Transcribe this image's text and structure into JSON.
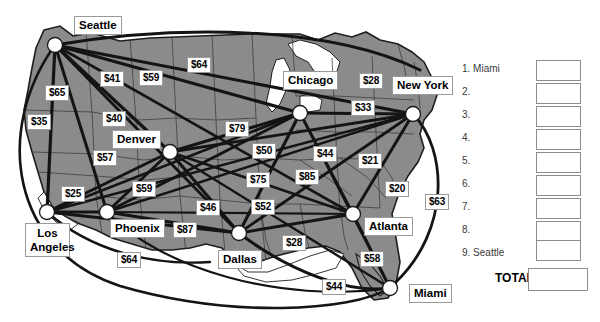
{
  "map": {
    "title": "US airline route map with fares",
    "fill_color": "#8c8c8c",
    "route_color": "#1a1a1a",
    "border_color": "#2b2b2b",
    "node_color": "#ffffff",
    "cities": [
      {
        "name": "Seattle",
        "label": "Seattle",
        "x": 55,
        "y": 45,
        "lx": 74,
        "ly": 16
      },
      {
        "name": "Denver",
        "label": "Denver",
        "x": 170,
        "y": 152,
        "lx": 112,
        "ly": 130
      },
      {
        "name": "Chicago",
        "label": "Chicago",
        "x": 300,
        "y": 113,
        "lx": 283,
        "ly": 71
      },
      {
        "name": "NewYork",
        "label": "New York",
        "x": 413,
        "y": 114,
        "lx": 392,
        "ly": 76
      },
      {
        "name": "LosAngeles",
        "label": "Los\nAngeles",
        "x": 47,
        "y": 212,
        "lx": 25,
        "ly": 223
      },
      {
        "name": "Phoenix",
        "label": "Phoenix",
        "x": 107,
        "y": 212,
        "lx": 110,
        "ly": 219
      },
      {
        "name": "Dallas",
        "label": "Dallas",
        "x": 239,
        "y": 233,
        "lx": 218,
        "ly": 250
      },
      {
        "name": "Atlanta",
        "label": "Atlanta",
        "x": 353,
        "y": 214,
        "lx": 364,
        "ly": 217
      },
      {
        "name": "Miami",
        "label": "Miami",
        "x": 390,
        "y": 288,
        "lx": 409,
        "ly": 284
      }
    ],
    "fares": [
      {
        "id": "f65",
        "value": "$65",
        "x": 45,
        "y": 85
      },
      {
        "id": "f35",
        "value": "$35",
        "x": 27,
        "y": 114
      },
      {
        "id": "f41",
        "value": "$41",
        "x": 100,
        "y": 71
      },
      {
        "id": "f59a",
        "value": "$59",
        "x": 139,
        "y": 70
      },
      {
        "id": "f64a",
        "value": "$64",
        "x": 187,
        "y": 57
      },
      {
        "id": "f40",
        "value": "$40",
        "x": 102,
        "y": 111
      },
      {
        "id": "f57",
        "value": "$57",
        "x": 93,
        "y": 150
      },
      {
        "id": "f25",
        "value": "$25",
        "x": 61,
        "y": 186
      },
      {
        "id": "f59b",
        "value": "$59",
        "x": 132,
        "y": 181
      },
      {
        "id": "f79",
        "value": "$79",
        "x": 225,
        "y": 121
      },
      {
        "id": "f50",
        "value": "$50",
        "x": 252,
        "y": 143
      },
      {
        "id": "f75",
        "value": "$75",
        "x": 246,
        "y": 172
      },
      {
        "id": "f46",
        "value": "$46",
        "x": 196,
        "y": 200
      },
      {
        "id": "f52",
        "value": "$52",
        "x": 251,
        "y": 199
      },
      {
        "id": "f87",
        "value": "$87",
        "x": 173,
        "y": 222
      },
      {
        "id": "f64b",
        "value": "$64",
        "x": 117,
        "y": 252
      },
      {
        "id": "f28a",
        "value": "$28",
        "x": 359,
        "y": 73
      },
      {
        "id": "f33",
        "value": "$33",
        "x": 351,
        "y": 100
      },
      {
        "id": "f44a",
        "value": "$44",
        "x": 313,
        "y": 146
      },
      {
        "id": "f21",
        "value": "$21",
        "x": 358,
        "y": 153
      },
      {
        "id": "f85",
        "value": "$85",
        "x": 295,
        "y": 169
      },
      {
        "id": "f20",
        "value": "$20",
        "x": 385,
        "y": 181
      },
      {
        "id": "f63",
        "value": "$63",
        "x": 425,
        "y": 194
      },
      {
        "id": "f28b",
        "value": "$28",
        "x": 282,
        "y": 235
      },
      {
        "id": "f58",
        "value": "$58",
        "x": 360,
        "y": 251
      },
      {
        "id": "f44b",
        "value": "$44",
        "x": 322,
        "y": 279
      }
    ]
  },
  "panel": {
    "rows": [
      {
        "num": "1.",
        "label": "1. Miami"
      },
      {
        "num": "2.",
        "label": "2."
      },
      {
        "num": "3.",
        "label": "3."
      },
      {
        "num": "4.",
        "label": "4."
      },
      {
        "num": "5.",
        "label": "5."
      },
      {
        "num": "6.",
        "label": "6."
      },
      {
        "num": "7.",
        "label": "7."
      },
      {
        "num": "8.",
        "label": "8."
      },
      {
        "num": "9.",
        "label": "9. Seattle"
      }
    ],
    "total_label": "TOTAL",
    "values": [
      "",
      "",
      "",
      "",
      "",
      "",
      "",
      "",
      ""
    ],
    "total_value": ""
  }
}
